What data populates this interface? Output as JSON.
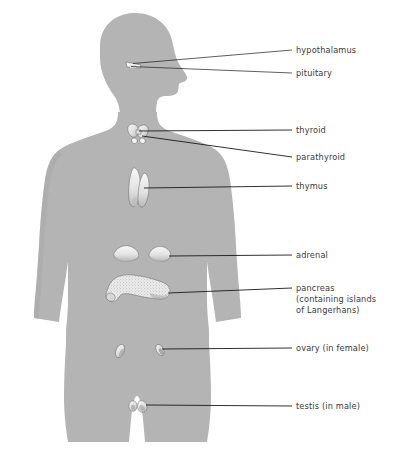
{
  "figure": {
    "background_color": "#ffffff",
    "body_fill": "#b4b4b4",
    "body_fill_shade": "#a8a8a8",
    "organ_fill": "#efefef",
    "organ_shade": "#c9c9c9",
    "label_color": "#3a3a3a",
    "leader_color": "#1a1a1a"
  },
  "labels": {
    "hypothalamus": "hypothalamus",
    "pituitary": "pituitary",
    "thyroid": "thyroid",
    "parathyroid": "parathyroid",
    "thymus": "thymus",
    "adrenal": "adrenal",
    "pancreas_line1": "pancreas",
    "pancreas_line2": "(containing islands",
    "pancreas_line3": "of Langerhans)",
    "ovary": "ovary (in female)",
    "testis": "testis (in male)"
  },
  "organs": [
    {
      "name": "hypothalamus",
      "label": "hypothalamus",
      "x": 133,
      "y": 63
    },
    {
      "name": "pituitary",
      "label": "pituitary",
      "x": 131,
      "y": 66
    },
    {
      "name": "thyroid",
      "label": "thyroid",
      "x": 138,
      "y": 131
    },
    {
      "name": "parathyroid",
      "label": "parathyroid",
      "x": 142,
      "y": 136
    },
    {
      "name": "thymus",
      "label": "thymus",
      "x": 143,
      "y": 188
    },
    {
      "name": "adrenal",
      "label": "adrenal",
      "x": 155,
      "y": 253
    },
    {
      "name": "pancreas",
      "label": "pancreas (containing islands of Langerhans)",
      "x": 140,
      "y": 289
    },
    {
      "name": "ovary",
      "label": "ovary (in female)",
      "x": 160,
      "y": 350
    },
    {
      "name": "testis",
      "label": "testis (in male)",
      "x": 140,
      "y": 405
    }
  ]
}
